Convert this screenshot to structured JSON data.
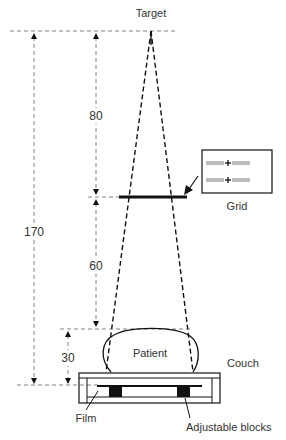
{
  "diagram": {
    "labels": {
      "target": "Target",
      "grid": "Grid",
      "patient": "Patient",
      "couch": "Couch",
      "film": "Film",
      "adjustable_blocks": "Adjustable blocks"
    },
    "dimensions": {
      "target_to_film": "170",
      "target_to_grid": "80",
      "grid_to_patient": "60",
      "patient_to_film": "30"
    },
    "colors": {
      "line": "#111111",
      "text": "#333333",
      "dashed": "#555555"
    }
  }
}
